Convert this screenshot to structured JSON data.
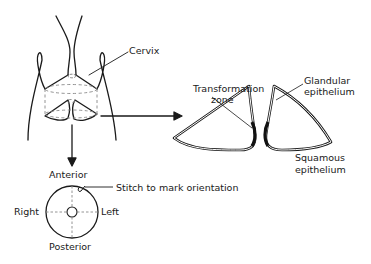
{
  "diagram": {
    "labels": {
      "cervix": "Cervix",
      "transformation_zone_1": "Transformation",
      "transformation_zone_2": "zone",
      "glandular_1": "Glandular",
      "glandular_2": "epithelium",
      "squamous_1": "Squamous",
      "squamous_2": "epithelium",
      "anterior": "Anterior",
      "posterior": "Posterior",
      "right": "Right",
      "left": "Left",
      "stitch": "Stitch to mark orientation"
    },
    "colors": {
      "line": "#1a1a1a",
      "dashed": "#888888",
      "background": "#ffffff"
    }
  }
}
